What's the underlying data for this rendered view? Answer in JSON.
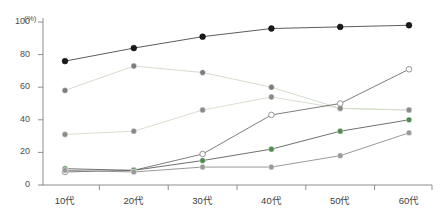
{
  "chart_data": {
    "type": "line",
    "title": "",
    "xlabel": "",
    "ylabel": "(%)",
    "unit": "(%)",
    "categories": [
      "10代",
      "20代",
      "30代",
      "40代",
      "50代",
      "60代"
    ],
    "ylim": [
      0,
      100
    ],
    "yticks": [
      0,
      20,
      40,
      60,
      80,
      100
    ],
    "grid": false,
    "legend": "none",
    "series": [
      {
        "name": "series-1",
        "marker": "filled-black",
        "color": "#1a1a1a",
        "line_color": "#4a4a4a",
        "values": [
          76,
          84,
          91,
          96,
          97,
          98
        ]
      },
      {
        "name": "series-2",
        "marker": "filled-gray",
        "color": "#7c7c7c",
        "line_color": "#cfd9c6",
        "values": [
          58,
          73,
          69,
          60,
          47,
          46
        ]
      },
      {
        "name": "series-3",
        "marker": "filled-gray",
        "color": "#8a8a8a",
        "line_color": "#d3ddc9",
        "values": [
          31,
          33,
          46,
          54,
          47,
          46
        ]
      },
      {
        "name": "series-4",
        "marker": "open-white",
        "color": "#ffffff",
        "line_color": "#6f6f6f",
        "values": [
          8,
          9,
          19,
          43,
          50,
          71
        ]
      },
      {
        "name": "series-5",
        "marker": "filled-green",
        "color": "#4f8a4f",
        "line_color": "#5f5f5f",
        "values": [
          10,
          9,
          15,
          22,
          33,
          40
        ]
      },
      {
        "name": "series-6",
        "marker": "filled-gray",
        "color": "#9a9a9a",
        "line_color": "#8f8f8f",
        "values": [
          9,
          8,
          11,
          11,
          18,
          32
        ]
      }
    ]
  },
  "axis": {
    "ytick_labels": [
      "100",
      "80",
      "60",
      "40",
      "20",
      "0"
    ],
    "xtick_labels": [
      "10代",
      "20代",
      "30代",
      "40代",
      "50代",
      "60代"
    ]
  }
}
